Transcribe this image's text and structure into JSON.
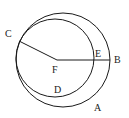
{
  "diagram": {
    "type": "geometry",
    "stroke_color": "#1a1a1a",
    "circles": [
      {
        "name": "outer-circle",
        "cx": 63,
        "cy": 60,
        "r": 47
      },
      {
        "name": "inner-circle",
        "cx": 55,
        "cy": 58,
        "r": 39
      }
    ],
    "segments": [
      {
        "name": "segment-FC",
        "from": "F",
        "to": "C"
      },
      {
        "name": "segment-FB",
        "from": "F",
        "to": "B"
      }
    ],
    "points": {
      "A": {
        "label": "A",
        "x": 94,
        "y": 107
      },
      "B": {
        "label": "B",
        "x": 114,
        "y": 63
      },
      "C": {
        "label": "C",
        "x": 5,
        "y": 37
      },
      "D": {
        "label": "D",
        "x": 54,
        "y": 93
      },
      "E": {
        "label": "E",
        "x": 95,
        "y": 57
      },
      "F": {
        "label": "F",
        "x": 52,
        "y": 73
      }
    }
  }
}
